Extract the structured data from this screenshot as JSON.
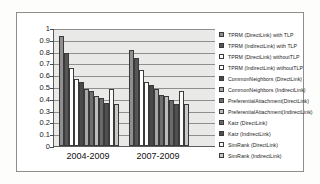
{
  "chart_data": {
    "type": "bar",
    "title": "",
    "xlabel": "",
    "ylabel": "",
    "ylim": [
      0,
      1
    ],
    "ytick_labels": [
      "1",
      "0.9",
      "0.8",
      "0.7",
      "0.6",
      "0.5",
      "0.4",
      "0.3",
      "0.2",
      "0.1",
      "0"
    ],
    "ytick_values": [
      1,
      0.9,
      0.8,
      0.7,
      0.6,
      0.5,
      0.4,
      0.3,
      0.2,
      0.1,
      0
    ],
    "grid": true,
    "legend_position": "right",
    "categories": [
      "2004-2009",
      "2007-2009"
    ],
    "series": [
      {
        "name": "TPRM (DirectLink) with TLP",
        "color": "#8f8f8f",
        "values": [
          0.935,
          0.815
        ]
      },
      {
        "name": "TPRM (IndirectLink) with TLP",
        "color": "#565656",
        "values": [
          0.79,
          0.745
        ]
      },
      {
        "name": "TPRM (DirectLink) withoutTLP",
        "color": "#ffffff",
        "values": [
          0.665,
          0.64
        ]
      },
      {
        "name": "TPRM (IndirectLink) withoutTLP",
        "color": "#fdfdfd",
        "values": [
          0.565,
          0.545
        ]
      },
      {
        "name": "CommonNeighbors (DirectLink)",
        "color": "#4a4a4a",
        "values": [
          0.545,
          0.515
        ]
      },
      {
        "name": "CommonNeighbors (IndirectLink)",
        "color": "#a8a8a8",
        "values": [
          0.485,
          0.48
        ]
      },
      {
        "name": "PreferentialAttachment(DirectLink)",
        "color": "#6e6e6e",
        "values": [
          0.47,
          0.43
        ]
      },
      {
        "name": "PreferentialAttachment(IndirectLink)",
        "color": "#bdbdbd",
        "values": [
          0.425,
          0.42
        ]
      },
      {
        "name": "Katz (DirectLink)",
        "color": "#6a6a6a",
        "values": [
          0.405,
          0.39
        ]
      },
      {
        "name": "Katz (IndirectLink)",
        "color": "#4f4f4f",
        "values": [
          0.365,
          0.355
        ]
      },
      {
        "name": "SimRank (DirectLink)",
        "color": "#fafafa",
        "values": [
          0.485,
          0.47
        ]
      },
      {
        "name": "SimRank (IndirectLink)",
        "color": "#c9c9c9",
        "values": [
          0.355,
          0.355
        ]
      }
    ]
  }
}
